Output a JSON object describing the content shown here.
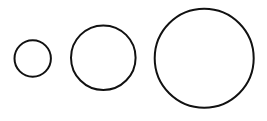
{
  "diagram": {
    "background": "#ffffff",
    "stroke_color": "#111111",
    "stroke_width": 2,
    "circles": [
      {
        "name": "small",
        "cx": 32.7,
        "cy": 58.5,
        "r": 18.2
      },
      {
        "name": "medium",
        "cx": 103.3,
        "cy": 57.7,
        "r": 32.3
      },
      {
        "name": "large",
        "cx": 204.2,
        "cy": 58.3,
        "r": 49.5
      }
    ]
  }
}
